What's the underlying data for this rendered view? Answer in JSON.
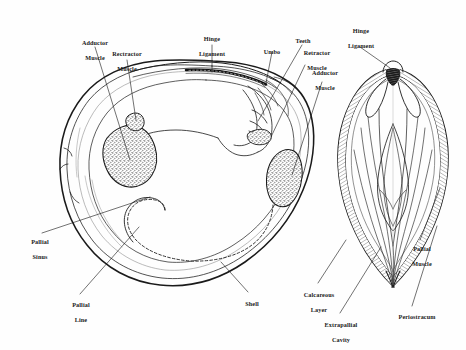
{
  "figure": {
    "background_color": "#fefefe",
    "ink_color": "#1a1a1a",
    "width": 466,
    "height": 350
  },
  "views": [
    {
      "id": "interior-valve",
      "name": "Interior view of left valve",
      "description": "Inner surface of a single bivalve valve showing muscle scars, hinge, pallial line and pallial sinus."
    },
    {
      "id": "cross-section",
      "name": "Transverse cross-section through both valves",
      "description": "Cut-away of the closed bivalve showing shell layers, extrapallial cavity and mantle muscles."
    }
  ],
  "labels": [
    {
      "id": "adductor-muscle-left",
      "text": "Adductor\nMuscle",
      "line1": "Adductor",
      "line2": "Muscle",
      "view": "interior-valve"
    },
    {
      "id": "rectractor-muscle-left",
      "text": "Rectractor\nMuscle",
      "line1": "Rectractor",
      "line2": "Muscle",
      "view": "interior-valve"
    },
    {
      "id": "hinge-ligament-left",
      "text": "Hinge\nLigament",
      "line1": "Hinge",
      "line2": "Ligament",
      "view": "interior-valve"
    },
    {
      "id": "umbo",
      "text": "Umbo",
      "line1": "Umbo",
      "line2": "",
      "view": "interior-valve"
    },
    {
      "id": "teeth",
      "text": "Teeth",
      "line1": "Teeth",
      "line2": "",
      "view": "interior-valve"
    },
    {
      "id": "retractor-muscle-right",
      "text": "Retractor\nMuscle",
      "line1": "Retractor",
      "line2": "Muscle",
      "view": "interior-valve"
    },
    {
      "id": "adductor-muscle-right",
      "text": "Adductor\nMuscle",
      "line1": "Adductor",
      "line2": "Muscle",
      "view": "interior-valve"
    },
    {
      "id": "hinge-ligament-right",
      "text": "Hinge\nLigament",
      "line1": "Hinge",
      "line2": "Ligament",
      "view": "cross-section"
    },
    {
      "id": "pallial-sinus",
      "text": "Pallial\nSinus",
      "line1": "Pallial",
      "line2": "Sinus",
      "view": "interior-valve"
    },
    {
      "id": "pallial-line",
      "text": "Pallial\nLine",
      "line1": "Pallial",
      "line2": "Line",
      "view": "interior-valve"
    },
    {
      "id": "shell",
      "text": "Shell",
      "line1": "Shell",
      "line2": "",
      "view": "interior-valve"
    },
    {
      "id": "pallial-muscle",
      "text": "Pallial\nMuscle",
      "line1": "Pallial",
      "line2": "Muscle",
      "view": "cross-section"
    },
    {
      "id": "calcareous-layer",
      "text": "Calcareous\nLayer",
      "line1": "Calcareous",
      "line2": "Layer",
      "view": "cross-section"
    },
    {
      "id": "extrapallial-cavity",
      "text": "Extrapallial\nCavity",
      "line1": "Extrapallial",
      "line2": "Cavity",
      "view": "cross-section"
    },
    {
      "id": "periostracum",
      "text": "Periostracum",
      "line1": "Periostracum",
      "line2": "",
      "view": "cross-section"
    }
  ]
}
